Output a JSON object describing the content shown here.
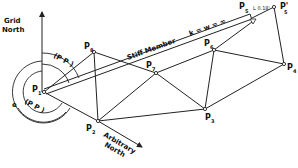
{
  "diagram": {
    "type": "survey traverse network",
    "labels": {
      "grid_north_line1": "Grid",
      "grid_north_line2": "North",
      "arbitrary_north_line1": "Arbitrary",
      "arbitrary_north_line2": "North",
      "stiff_member": "Stiff Member",
      "stiffness": "k = w = ∞",
      "offset": "L 0.18'",
      "angle_top": "(P P )",
      "angle_top_sub1": "1",
      "angle_top_sub2": "5",
      "angle_top_sub3": "8",
      "angle_bottom_prefix": "e",
      "angle_bottom": "(P P )",
      "angle_bottom_sub1": "1",
      "angle_bottom_sub2": "5",
      "angle_bottom_sub3": "4"
    },
    "points": [
      {
        "id": "P1",
        "label": "P",
        "sub": "1",
        "x": 44,
        "y": 92
      },
      {
        "id": "P2",
        "label": "P",
        "sub": "2",
        "x": 98,
        "y": 121
      },
      {
        "id": "P3",
        "label": "P",
        "sub": "3",
        "x": 205,
        "y": 109
      },
      {
        "id": "P4",
        "label": "P",
        "sub": "4",
        "x": 284,
        "y": 64
      },
      {
        "id": "P5",
        "label": "P",
        "sub": "5",
        "x": 252,
        "y": 18
      },
      {
        "id": "P5'",
        "label": "P'",
        "sub": "5",
        "x": 274,
        "y": 7
      },
      {
        "id": "P6",
        "label": "P",
        "sub": "6",
        "x": 214,
        "y": 50
      },
      {
        "id": "P7",
        "label": "P",
        "sub": "7",
        "x": 156,
        "y": 73
      },
      {
        "id": "P8",
        "label": "P",
        "sub": "8",
        "x": 94,
        "y": 52
      }
    ],
    "edges": [
      [
        "P1",
        "P2"
      ],
      [
        "P1",
        "P8"
      ],
      [
        "P1",
        "P7"
      ],
      [
        "P2",
        "P8"
      ],
      [
        "P2",
        "P7"
      ],
      [
        "P2",
        "P3"
      ],
      [
        "P2",
        "P4"
      ],
      [
        "P7",
        "P8"
      ],
      [
        "P7",
        "P6"
      ],
      [
        "P7",
        "P3"
      ],
      [
        "P6",
        "P3"
      ],
      [
        "P6",
        "P4"
      ],
      [
        "P6",
        "P5"
      ],
      [
        "P3",
        "P4"
      ],
      [
        "P4",
        "P5'"
      ],
      [
        "P5",
        "P5'"
      ]
    ]
  }
}
